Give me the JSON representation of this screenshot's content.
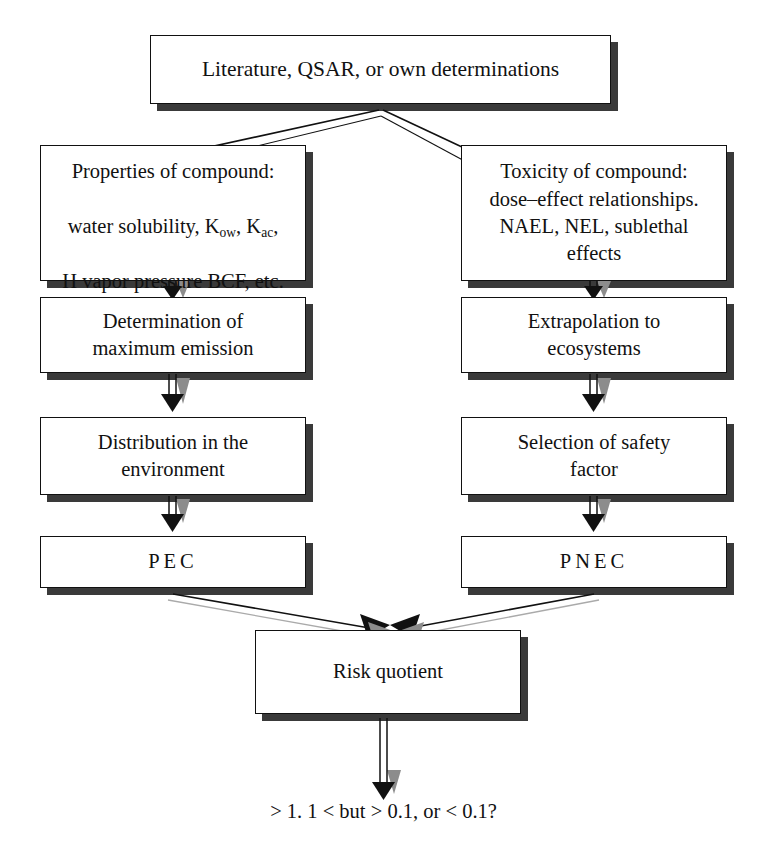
{
  "diagram": {
    "colors": {
      "box_fill": "#ffffff",
      "box_border": "#111111",
      "box_shadow": "#3a3a3a",
      "arrow_solid": "#111111",
      "arrow_shadow": "#808080",
      "background": "#ffffff",
      "text": "#111111"
    },
    "nodes": {
      "source": {
        "label": "Literature, QSAR, or own determinations"
      },
      "properties": {
        "line1": "Properties of compound:",
        "line2_pre": "water solubility, K",
        "line2_sub1": "ow",
        "line2_mid": ", K",
        "line2_sub2": "ac",
        "line2_post": ",",
        "line3": "H vapor pressure BCF, etc."
      },
      "toxicity": {
        "label": "Toxicity of compound:\ndose–effect relationships.\nNAEL, NEL, sublethal\neffects"
      },
      "emission": {
        "label": "Determination of\nmaximum emission"
      },
      "extrapolation": {
        "label": "Extrapolation to\necosystems"
      },
      "distribution": {
        "label": "Distribution in the\nenvironment"
      },
      "safety": {
        "label": "Selection of  safety\nfactor"
      },
      "pec": {
        "label": "PEC"
      },
      "pnec": {
        "label": "PNEC"
      },
      "risk": {
        "label": "Risk quotient"
      }
    },
    "caption": {
      "label": "> 1. 1 < but > 0.1, or < 0.1?"
    },
    "edges": [
      {
        "from": "source",
        "to": "properties",
        "style": "double-line-diagonal"
      },
      {
        "from": "source",
        "to": "toxicity",
        "style": "double-line-diagonal"
      },
      {
        "from": "properties",
        "to": "emission",
        "style": "double-line-vertical"
      },
      {
        "from": "toxicity",
        "to": "extrapolation",
        "style": "double-line-vertical"
      },
      {
        "from": "emission",
        "to": "distribution",
        "style": "double-line-vertical"
      },
      {
        "from": "extrapolation",
        "to": "safety",
        "style": "double-line-vertical"
      },
      {
        "from": "distribution",
        "to": "pec",
        "style": "double-line-vertical"
      },
      {
        "from": "safety",
        "to": "pnec",
        "style": "double-line-vertical"
      },
      {
        "from": "pec",
        "to": "risk",
        "style": "double-line-diagonal"
      },
      {
        "from": "pnec",
        "to": "risk",
        "style": "double-line-diagonal"
      },
      {
        "from": "risk",
        "to": "caption",
        "style": "double-line-vertical"
      }
    ]
  }
}
